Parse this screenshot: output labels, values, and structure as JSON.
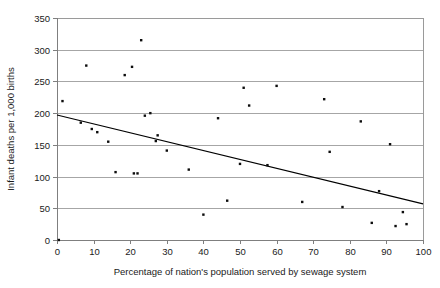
{
  "chart_data": {
    "type": "scatter",
    "title": "",
    "xlabel": "Percentage of nation's population served by sewage system",
    "ylabel": "Infant deaths per 1,000 births",
    "xlim": [
      0,
      100
    ],
    "ylim": [
      0,
      350
    ],
    "xticks": [
      0,
      10,
      20,
      30,
      40,
      50,
      60,
      70,
      80,
      90,
      100
    ],
    "yticks": [
      0,
      50,
      100,
      150,
      200,
      250,
      300,
      350
    ],
    "grid": "horizontal",
    "legend": "none",
    "marker_color": "#0d0d0d",
    "gridline_color": "#a6a6a6",
    "trendline_color": "#000000",
    "points": [
      {
        "x": 0.5,
        "y": 0
      },
      {
        "x": 1.5,
        "y": 219
      },
      {
        "x": 6.5,
        "y": 185
      },
      {
        "x": 8,
        "y": 275
      },
      {
        "x": 9.5,
        "y": 175
      },
      {
        "x": 11,
        "y": 170
      },
      {
        "x": 14,
        "y": 155
      },
      {
        "x": 16,
        "y": 107
      },
      {
        "x": 18.5,
        "y": 260
      },
      {
        "x": 20.5,
        "y": 273
      },
      {
        "x": 21,
        "y": 105
      },
      {
        "x": 22,
        "y": 105
      },
      {
        "x": 23,
        "y": 315
      },
      {
        "x": 24,
        "y": 196
      },
      {
        "x": 25.5,
        "y": 200
      },
      {
        "x": 27,
        "y": 156
      },
      {
        "x": 27.5,
        "y": 165
      },
      {
        "x": 30,
        "y": 141
      },
      {
        "x": 36,
        "y": 111
      },
      {
        "x": 40,
        "y": 40
      },
      {
        "x": 44,
        "y": 192
      },
      {
        "x": 46.5,
        "y": 62
      },
      {
        "x": 50,
        "y": 120
      },
      {
        "x": 51,
        "y": 240
      },
      {
        "x": 52.5,
        "y": 212
      },
      {
        "x": 57.5,
        "y": 118
      },
      {
        "x": 60,
        "y": 243
      },
      {
        "x": 67,
        "y": 60
      },
      {
        "x": 73,
        "y": 222
      },
      {
        "x": 74.5,
        "y": 139
      },
      {
        "x": 78,
        "y": 52
      },
      {
        "x": 83,
        "y": 187
      },
      {
        "x": 86,
        "y": 27
      },
      {
        "x": 88,
        "y": 77
      },
      {
        "x": 91,
        "y": 151
      },
      {
        "x": 92.5,
        "y": 22
      },
      {
        "x": 94.5,
        "y": 44
      },
      {
        "x": 95.5,
        "y": 25
      }
    ],
    "trendline": {
      "x0": 0,
      "y0": 197,
      "x1": 100,
      "y1": 57
    }
  },
  "caption": {
    "text": ""
  }
}
